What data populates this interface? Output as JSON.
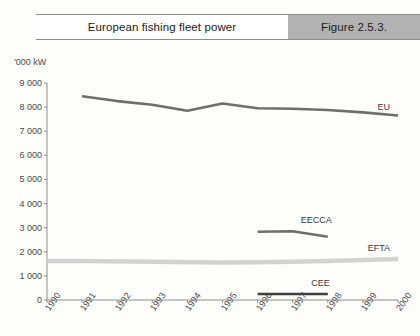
{
  "banner": {
    "title": "European fishing fleet power",
    "figure": "Figure 2.5.3.",
    "figure_bg": "#b2b2b2"
  },
  "chart_data": {
    "type": "line",
    "title": "European fishing fleet power",
    "xlabel": "",
    "ylabel": "'000 kW",
    "unit_label": "'000 kW",
    "grid": false,
    "legend": "inline-right",
    "x": [
      1990,
      1991,
      1992,
      1993,
      1994,
      1995,
      1996,
      1997,
      1998,
      1999,
      2000
    ],
    "xticklabels": [
      "1990",
      "1991",
      "1992",
      "1993",
      "1994",
      "1995",
      "1996",
      "1997",
      "1998",
      "1999",
      "2000"
    ],
    "ylim": [
      0,
      9000
    ],
    "yticks": [
      0,
      1000,
      2000,
      3000,
      4000,
      5000,
      6000,
      7000,
      8000,
      9000
    ],
    "yticklabels": [
      "0",
      "1 000",
      "2 000",
      "3 000",
      "4 000",
      "5 000",
      "6 000",
      "7 000",
      "8 000",
      "9 000"
    ],
    "series": [
      {
        "name": "EU",
        "color": "#6e6e6e",
        "x": [
          1991,
          1992,
          1993,
          1994,
          1995,
          1996,
          1997,
          1998,
          1999,
          2000
        ],
        "values": [
          8450,
          8250,
          8100,
          7850,
          8150,
          7950,
          7930,
          7880,
          7780,
          7650
        ]
      },
      {
        "name": "EECCA",
        "color": "#6e6e6e",
        "x": [
          1996,
          1997,
          1998
        ],
        "values": [
          2830,
          2850,
          2620
        ]
      },
      {
        "name": "EFTA",
        "color": "#d2d2d2",
        "x": [
          1990,
          1991,
          1995,
          1996,
          1997,
          1998,
          1999,
          2000
        ],
        "values": [
          1620,
          1620,
          1560,
          1570,
          1590,
          1620,
          1660,
          1700
        ]
      },
      {
        "name": "CEE",
        "color": "#3f3f3f",
        "x": [
          1996,
          1997,
          1998
        ],
        "values": [
          250,
          250,
          250
        ]
      }
    ],
    "series_labels": [
      {
        "name": "EU",
        "text": "EU"
      },
      {
        "name": "EECCA",
        "text": "EECCA"
      },
      {
        "name": "EFTA",
        "text": "EFTA"
      },
      {
        "name": "CEE",
        "text": "CEE"
      }
    ]
  }
}
